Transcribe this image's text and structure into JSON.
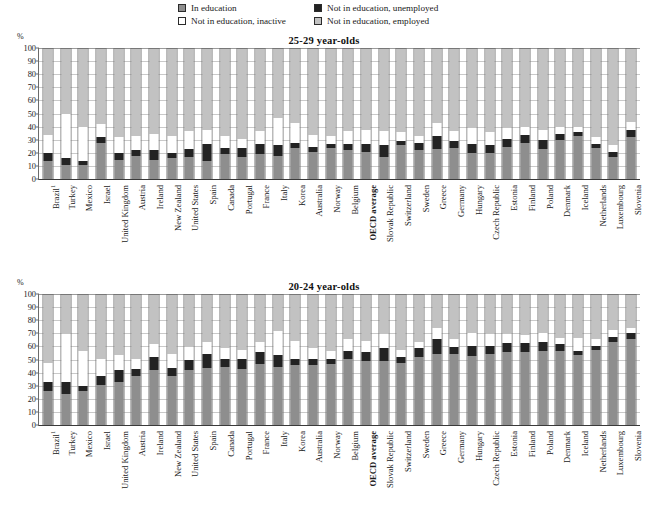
{
  "legend": {
    "items": [
      {
        "key": "education",
        "label": "In education",
        "color": "#8e8e8e",
        "icon": "square-swatch-icon"
      },
      {
        "key": "unemployed",
        "label": "Not in education, unemployed",
        "color": "#232323",
        "icon": "square-swatch-icon"
      },
      {
        "key": "inactive",
        "label": "Not in education, inactive",
        "color": "#ffffff",
        "icon": "square-swatch-icon"
      },
      {
        "key": "employed",
        "label": "Not in education, employed",
        "color": "#c2c2c2",
        "icon": "square-swatch-icon"
      }
    ]
  },
  "axis": {
    "unit": "%",
    "ticks": [
      "100",
      "90",
      "80",
      "70",
      "60",
      "50",
      "40",
      "30",
      "20",
      "10",
      "0"
    ]
  },
  "chart_data": [
    {
      "type": "bar",
      "stacked": true,
      "title": "25-29 year-olds",
      "xlabel": "",
      "ylabel": "%",
      "ylim": [
        0,
        100
      ],
      "grid": true,
      "legend_position": "top",
      "categories": [
        "Brazil¹",
        "Turkey",
        "Mexico",
        "Israel",
        "United Kingdom",
        "Austria",
        "Ireland",
        "New Zealand",
        "United States",
        "Spain",
        "Canada",
        "Portugal",
        "France",
        "Italy",
        "Korea",
        "Australia",
        "Norway",
        "Belgium",
        "OECD average",
        "Slovak Republic",
        "Switzerland",
        "Sweden",
        "Greece",
        "Germany",
        "Hungary",
        "Czech Republic",
        "Estonia",
        "Finland",
        "Poland",
        "Denmark",
        "Iceland",
        "Netherlands",
        "Luxembourg",
        "Slovenia"
      ],
      "series": [
        {
          "name": "In education",
          "color": "#8e8e8e",
          "values": [
            14,
            11,
            11,
            28,
            15,
            18,
            15,
            16,
            17,
            14,
            19,
            17,
            19,
            18,
            24,
            21,
            24,
            22,
            21,
            17,
            26,
            22,
            23,
            24,
            20,
            20,
            25,
            28,
            23,
            30,
            33,
            24,
            17,
            32
          ]
        },
        {
          "name": "Not in education, unemployed",
          "color": "#232323",
          "values": [
            6,
            5,
            3,
            4,
            5,
            4,
            7,
            4,
            6,
            13,
            5,
            7,
            8,
            8,
            4,
            4,
            3,
            5,
            6,
            9,
            3,
            6,
            10,
            5,
            7,
            6,
            6,
            6,
            7,
            5,
            3,
            3,
            4,
            6
          ]
        },
        {
          "name": "Not in education, inactive",
          "color": "#ffffff",
          "values": [
            14,
            34,
            26,
            10,
            12,
            11,
            13,
            13,
            14,
            11,
            9,
            7,
            10,
            21,
            15,
            9,
            6,
            10,
            11,
            11,
            7,
            5,
            10,
            8,
            12,
            10,
            8,
            6,
            8,
            5,
            4,
            5,
            5,
            6
          ]
        },
        {
          "name": "Not in education, employed",
          "color": "#c2c2c2",
          "values": [
            66,
            50,
            60,
            58,
            68,
            67,
            65,
            67,
            63,
            62,
            67,
            69,
            63,
            53,
            57,
            66,
            67,
            63,
            62,
            63,
            64,
            67,
            57,
            63,
            61,
            64,
            61,
            60,
            62,
            60,
            60,
            68,
            74,
            56
          ]
        }
      ]
    },
    {
      "type": "bar",
      "stacked": true,
      "title": "20-24 year-olds",
      "xlabel": "",
      "ylabel": "%",
      "ylim": [
        0,
        100
      ],
      "grid": true,
      "legend_position": "top",
      "categories": [
        "Brazil¹",
        "Turkey",
        "Mexico",
        "Israel",
        "United Kingdom",
        "Austria",
        "Ireland",
        "New Zealand",
        "United States",
        "Spain",
        "Canada",
        "Portugal",
        "France",
        "Italy",
        "Korea",
        "Australia",
        "Norway",
        "Belgium",
        "OECD average",
        "Slovak Republic",
        "Switzerland",
        "Sweden",
        "Greece",
        "Germany",
        "Hungary",
        "Czech Republic",
        "Estonia",
        "Finland",
        "Poland",
        "Denmark",
        "Iceland",
        "Netherlands",
        "Luxembourg",
        "Slovenia"
      ],
      "series": [
        {
          "name": "In education",
          "color": "#8e8e8e",
          "values": [
            26,
            24,
            26,
            31,
            33,
            38,
            42,
            38,
            42,
            44,
            45,
            43,
            47,
            45,
            46,
            46,
            47,
            51,
            49,
            49,
            48,
            52,
            55,
            55,
            53,
            55,
            56,
            56,
            57,
            57,
            54,
            58,
            64,
            66
          ]
        },
        {
          "name": "Not in education, unemployed",
          "color": "#232323",
          "values": [
            7,
            9,
            4,
            7,
            9,
            5,
            10,
            6,
            8,
            11,
            6,
            8,
            9,
            9,
            5,
            5,
            4,
            6,
            7,
            10,
            4,
            7,
            11,
            5,
            8,
            6,
            7,
            7,
            7,
            5,
            3,
            3,
            4,
            5
          ]
        },
        {
          "name": "Not in education, inactive",
          "color": "#ffffff",
          "values": [
            15,
            37,
            27,
            13,
            12,
            8,
            10,
            11,
            10,
            9,
            8,
            7,
            8,
            18,
            14,
            8,
            6,
            9,
            9,
            11,
            6,
            5,
            9,
            6,
            10,
            9,
            7,
            6,
            7,
            5,
            10,
            5,
            5,
            4
          ]
        },
        {
          "name": "Not in education, employed",
          "color": "#c2c2c2",
          "values": [
            52,
            30,
            43,
            49,
            46,
            49,
            38,
            45,
            40,
            36,
            41,
            42,
            36,
            28,
            35,
            41,
            43,
            34,
            35,
            30,
            42,
            36,
            25,
            34,
            29,
            30,
            30,
            31,
            29,
            33,
            33,
            34,
            27,
            25
          ]
        }
      ]
    }
  ]
}
